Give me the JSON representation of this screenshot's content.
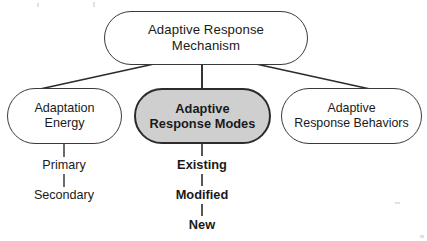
{
  "diagram": {
    "type": "hierarchy-tree",
    "title": "Adaptive Response Mechanism",
    "background_color": "#ffffff",
    "line_color": "#2b2b2b",
    "text_color": "#1a1a1a",
    "highlight_fill": "#cfcfcf",
    "nodes": {
      "root": {
        "label": "Adaptive Response\nMechanism",
        "level": 0,
        "shape": "rounded-rectangle",
        "fill": "#ffffff"
      },
      "adaptation_energy": {
        "label": "Adaptation\nEnergy",
        "level": 1,
        "shape": "rounded-rectangle",
        "fill": "#ffffff"
      },
      "adaptive_response_modes": {
        "label": "Adaptive\nResponse Modes",
        "level": 1,
        "shape": "rounded-rectangle",
        "fill": "#cfcfcf",
        "emphasis": "bold"
      },
      "adaptive_response_behaviors": {
        "label": "Adaptive\nResponse Behaviors",
        "level": 1,
        "shape": "rounded-rectangle",
        "fill": "#ffffff"
      }
    },
    "leaves": {
      "primary": {
        "label": "Primary",
        "parent": "adaptation_energy",
        "emphasis": "normal"
      },
      "secondary": {
        "label": "Secondary",
        "parent": "primary",
        "emphasis": "normal"
      },
      "existing": {
        "label": "Existing",
        "parent": "adaptive_response_modes",
        "emphasis": "bold"
      },
      "modified": {
        "label": "Modified",
        "parent": "existing",
        "emphasis": "bold"
      },
      "new": {
        "label": "New",
        "parent": "modified",
        "emphasis": "bold"
      }
    }
  }
}
